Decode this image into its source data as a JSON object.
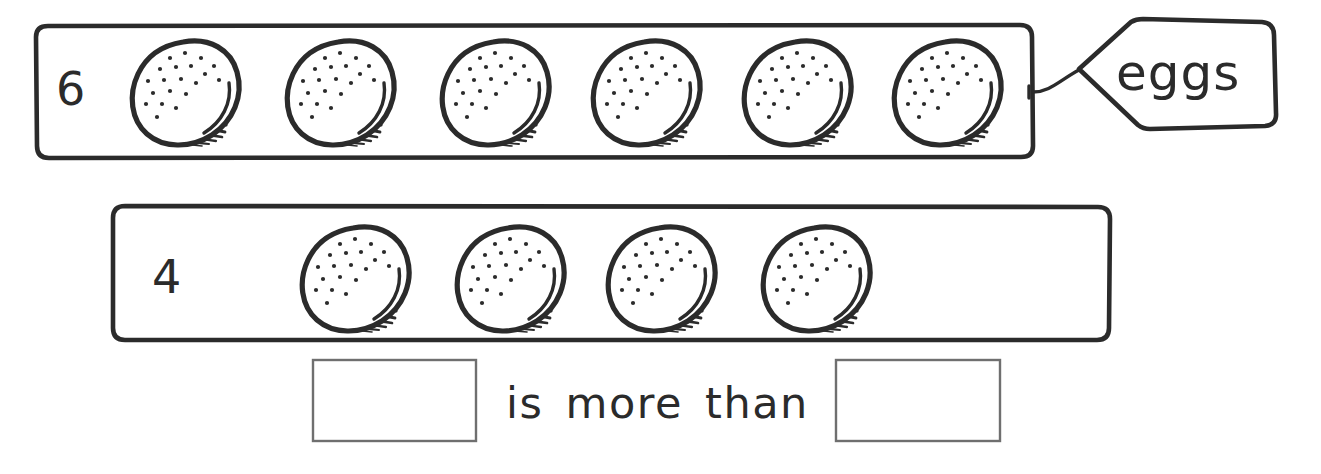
{
  "worksheet": {
    "title": "Comparing quantities of eggs",
    "background_color": "#ffffff",
    "ink_color": "#2b2b2b",
    "box_border_color": "#6f6f6f"
  },
  "rows": [
    {
      "id": "row-top",
      "count_label": "6",
      "count_value": 6,
      "item_name": "egg",
      "item_count": 6,
      "tag": {
        "label": "eggs",
        "shape": "pointed-tag",
        "attached_to": "row-top"
      },
      "frame": {
        "x": 36,
        "y": 25,
        "width": 996,
        "height": 133
      }
    },
    {
      "id": "row-bottom",
      "count_label": "4",
      "count_value": 4,
      "item_name": "egg",
      "item_count": 4,
      "tag": null,
      "frame": {
        "x": 113,
        "y": 205,
        "width": 997,
        "height": 136
      }
    }
  ],
  "comparison": {
    "phrase": "is more than",
    "left_answer_box": {
      "value": "",
      "x": 313,
      "y": 360,
      "width": 163,
      "height": 81
    },
    "right_answer_box": {
      "value": "",
      "x": 836,
      "y": 360,
      "width": 164,
      "height": 81
    }
  },
  "icons": {
    "egg": "egg-icon",
    "tag": "tag-icon",
    "answer_box": "answer-box-icon"
  }
}
